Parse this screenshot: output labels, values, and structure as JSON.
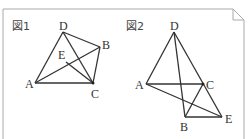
{
  "figures": [
    {
      "label": "図1",
      "points": {
        "A": {
          "label": "A",
          "x": 35,
          "y": 83
        },
        "B": {
          "label": "B",
          "x": 100,
          "y": 47
        },
        "C": {
          "label": "C",
          "x": 93,
          "y": 83
        },
        "D": {
          "label": "D",
          "x": 63,
          "y": 32
        },
        "E": {
          "label": "E",
          "x": 66,
          "y": 62
        }
      },
      "segments": [
        "AD",
        "DB",
        "BC",
        "CA",
        "DC",
        "AB",
        "EC"
      ]
    },
    {
      "label": "図2",
      "points": {
        "A": {
          "label": "A",
          "x": 146,
          "y": 84
        },
        "B": {
          "label": "B",
          "x": 185,
          "y": 117
        },
        "C": {
          "label": "C",
          "x": 203,
          "y": 84
        },
        "D": {
          "label": "D",
          "x": 174,
          "y": 32
        },
        "E": {
          "label": "E",
          "x": 222,
          "y": 117
        }
      },
      "segments": [
        "AD",
        "DE",
        "AC",
        "DB",
        "BE",
        "BC",
        "AE"
      ]
    }
  ],
  "colors": {
    "line": "#333333",
    "frame": "#aaaaaa"
  }
}
